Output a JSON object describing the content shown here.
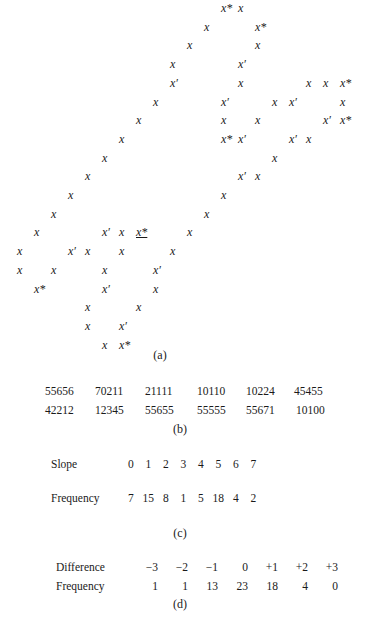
{
  "part_a": {
    "caption": "(a)",
    "grid": {
      "col_x0": 17,
      "col_step": 17,
      "row_y0": 2,
      "row_step": 18.7
    },
    "cells": [
      {
        "r": 0,
        "c": 12,
        "t": "x*"
      },
      {
        "r": 0,
        "c": 13,
        "t": "x"
      },
      {
        "r": 1,
        "c": 11,
        "t": "x"
      },
      {
        "r": 1,
        "c": 14,
        "t": "x*"
      },
      {
        "r": 2,
        "c": 10,
        "t": "x"
      },
      {
        "r": 2,
        "c": 14,
        "t": "x"
      },
      {
        "r": 3,
        "c": 9,
        "t": "x"
      },
      {
        "r": 3,
        "c": 13,
        "t": "x′"
      },
      {
        "r": 4,
        "c": 9,
        "t": "x′"
      },
      {
        "r": 4,
        "c": 13,
        "t": "x"
      },
      {
        "r": 4,
        "c": 17,
        "t": "x"
      },
      {
        "r": 4,
        "c": 18,
        "t": "x"
      },
      {
        "r": 4,
        "c": 19,
        "t": "x*"
      },
      {
        "r": 5,
        "c": 8,
        "t": "x"
      },
      {
        "r": 5,
        "c": 12,
        "t": "x′"
      },
      {
        "r": 5,
        "c": 15,
        "t": "x"
      },
      {
        "r": 5,
        "c": 16,
        "t": "x′"
      },
      {
        "r": 5,
        "c": 19,
        "t": "x"
      },
      {
        "r": 6,
        "c": 7,
        "t": "x"
      },
      {
        "r": 6,
        "c": 12,
        "t": "x"
      },
      {
        "r": 6,
        "c": 14,
        "t": "x"
      },
      {
        "r": 6,
        "c": 18,
        "t": "x′"
      },
      {
        "r": 6,
        "c": 19,
        "t": "x*"
      },
      {
        "r": 7,
        "c": 6,
        "t": "x"
      },
      {
        "r": 7,
        "c": 12,
        "t": "x*"
      },
      {
        "r": 7,
        "c": 13,
        "t": "x′"
      },
      {
        "r": 7,
        "c": 16,
        "t": "x′"
      },
      {
        "r": 7,
        "c": 17,
        "t": "x"
      },
      {
        "r": 8,
        "c": 5,
        "t": "x"
      },
      {
        "r": 8,
        "c": 15,
        "t": "x"
      },
      {
        "r": 9,
        "c": 4,
        "t": "x"
      },
      {
        "r": 9,
        "c": 13,
        "t": "x′"
      },
      {
        "r": 9,
        "c": 14,
        "t": "x"
      },
      {
        "r": 10,
        "c": 3,
        "t": "x"
      },
      {
        "r": 10,
        "c": 12,
        "t": "x"
      },
      {
        "r": 11,
        "c": 2,
        "t": "x"
      },
      {
        "r": 11,
        "c": 11,
        "t": "x"
      },
      {
        "r": 12,
        "c": 1,
        "t": "x"
      },
      {
        "r": 12,
        "c": 5,
        "t": "x′"
      },
      {
        "r": 12,
        "c": 6,
        "t": "x"
      },
      {
        "r": 12,
        "c": 7,
        "t": "x*",
        "underline": true
      },
      {
        "r": 12,
        "c": 10,
        "t": "x"
      },
      {
        "r": 13,
        "c": 0,
        "t": "x"
      },
      {
        "r": 13,
        "c": 3,
        "t": "x′"
      },
      {
        "r": 13,
        "c": 4,
        "t": "x"
      },
      {
        "r": 13,
        "c": 6,
        "t": "x"
      },
      {
        "r": 13,
        "c": 9,
        "t": "x"
      },
      {
        "r": 14,
        "c": 0,
        "t": "x"
      },
      {
        "r": 14,
        "c": 2,
        "t": "x"
      },
      {
        "r": 14,
        "c": 5,
        "t": "x"
      },
      {
        "r": 14,
        "c": 8,
        "t": "x′"
      },
      {
        "r": 15,
        "c": 1,
        "t": "x*"
      },
      {
        "r": 15,
        "c": 5,
        "t": "x′"
      },
      {
        "r": 15,
        "c": 8,
        "t": "x"
      },
      {
        "r": 16,
        "c": 4,
        "t": "x"
      },
      {
        "r": 16,
        "c": 7,
        "t": "x"
      },
      {
        "r": 17,
        "c": 4,
        "t": "x"
      },
      {
        "r": 17,
        "c": 6,
        "t": "x′"
      },
      {
        "r": 18,
        "c": 5,
        "t": "x"
      },
      {
        "r": 18,
        "c": 6,
        "t": "x*"
      }
    ]
  },
  "part_b": {
    "caption": "(b)",
    "rows": [
      [
        "55656",
        "70211",
        "21111",
        "10110",
        "10224",
        "45455"
      ],
      [
        "42212",
        "12345",
        "55655",
        "55555",
        "55671",
        "10100"
      ]
    ]
  },
  "part_c": {
    "caption": "(c)",
    "slope_label": "Slope",
    "slopes": [
      "0",
      "1",
      "2",
      "3",
      "4",
      "5",
      "6",
      "7"
    ],
    "frequency_label": "Frequency",
    "frequencies": [
      "7",
      "15",
      "8",
      "1",
      "5",
      "18",
      "4",
      "2"
    ]
  },
  "part_d": {
    "caption": "(d)",
    "difference_label": "Difference",
    "differences": [
      "−3",
      "−2",
      "−1",
      "0",
      "+1",
      "+2",
      "+3"
    ],
    "frequency_label": "Frequency",
    "frequencies": [
      "1",
      "1",
      "13",
      "23",
      "18",
      "4",
      "0"
    ]
  }
}
